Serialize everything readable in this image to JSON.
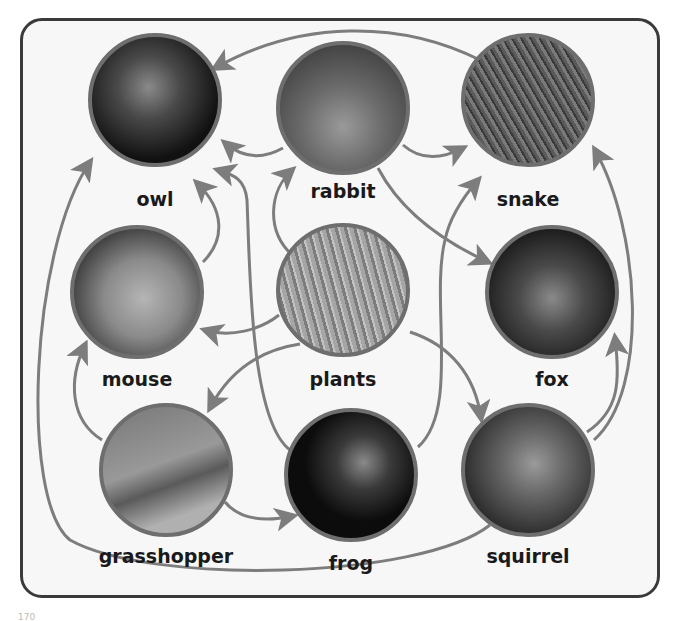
{
  "colors": {
    "frame": "#3a3a3a",
    "arrow": "#7d7d7d",
    "circle_border": "#6e6e6e",
    "background": "#f7f7f7"
  },
  "nodes": [
    {
      "id": "owl",
      "label": "owl",
      "cx": 155,
      "cy": 100,
      "image": "owl-photo",
      "fill": "#222"
    },
    {
      "id": "rabbit",
      "label": "rabbit",
      "cx": 343,
      "cy": 108,
      "image": "rabbit-photo",
      "fill": "#6a6a6a"
    },
    {
      "id": "snake",
      "label": "snake",
      "cx": 528,
      "cy": 100,
      "image": "snake-photo",
      "fill": "#555"
    },
    {
      "id": "mouse",
      "label": "mouse",
      "cx": 137,
      "cy": 292,
      "image": "mouse-photo",
      "fill": "#8a8a8a"
    },
    {
      "id": "plants",
      "label": "plants",
      "cx": 343,
      "cy": 290,
      "image": "grass-photo",
      "fill": "#9a9a9a"
    },
    {
      "id": "fox",
      "label": "fox",
      "cx": 552,
      "cy": 292,
      "image": "fox-photo",
      "fill": "#3c3c3c"
    },
    {
      "id": "grasshopper",
      "label": "grasshopper",
      "cx": 166,
      "cy": 470,
      "image": "grasshopper-photo",
      "fill": "#8f8f8f"
    },
    {
      "id": "frog",
      "label": "frog",
      "cx": 351,
      "cy": 475,
      "image": "frog-photo",
      "fill": "#151515"
    },
    {
      "id": "squirrel",
      "label": "squirrel",
      "cx": 528,
      "cy": 470,
      "image": "squirrel-photo",
      "fill": "#4a4a4a"
    }
  ],
  "edges": [
    {
      "from": "snake",
      "to": "owl"
    },
    {
      "from": "rabbit",
      "to": "owl"
    },
    {
      "from": "mouse",
      "to": "owl"
    },
    {
      "from": "frog",
      "to": "owl"
    },
    {
      "from": "squirrel",
      "to": "owl"
    },
    {
      "from": "plants",
      "to": "rabbit"
    },
    {
      "from": "rabbit",
      "to": "snake"
    },
    {
      "from": "rabbit",
      "to": "fox"
    },
    {
      "from": "frog",
      "to": "snake"
    },
    {
      "from": "squirrel",
      "to": "snake"
    },
    {
      "from": "plants",
      "to": "mouse"
    },
    {
      "from": "plants",
      "to": "grasshopper"
    },
    {
      "from": "plants",
      "to": "squirrel"
    },
    {
      "from": "grasshopper",
      "to": "mouse"
    },
    {
      "from": "grasshopper",
      "to": "frog"
    },
    {
      "from": "squirrel",
      "to": "fox"
    }
  ],
  "page_number": "170"
}
